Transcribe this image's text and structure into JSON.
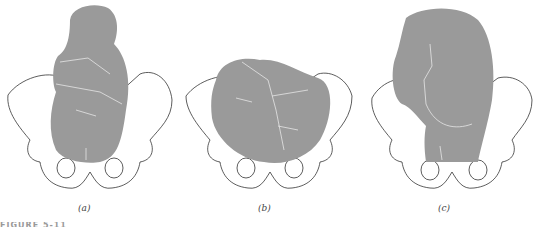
{
  "figure": {
    "caption_clipped": "FIGURE 5-11",
    "fill_color": "#9a9a9a",
    "bone_stroke": "#333333",
    "panels": [
      {
        "id": "a",
        "label": "(a)",
        "description": "Fetus in vertical (longitudinal) lie within the pelvis, arms crossed, legs flexed"
      },
      {
        "id": "b",
        "label": "(b)",
        "description": "Fetus in transverse lie across the pelvis"
      },
      {
        "id": "c",
        "label": "(c)",
        "description": "Fetus in breech position viewed from behind over the pelvis"
      }
    ]
  }
}
